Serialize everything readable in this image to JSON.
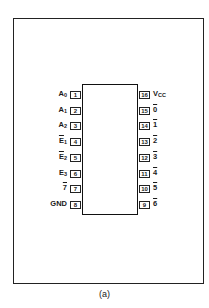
{
  "diagram": {
    "type": "ic-pinout",
    "package": "16-pin DIP",
    "caption": "(a)",
    "left_pins": [
      {
        "num": "1",
        "name": "A",
        "sub": "0",
        "overline": false
      },
      {
        "num": "2",
        "name": "A",
        "sub": "1",
        "overline": false
      },
      {
        "num": "3",
        "name": "A",
        "sub": "2",
        "overline": false
      },
      {
        "num": "4",
        "name": "E",
        "sub": "1",
        "overline": true
      },
      {
        "num": "5",
        "name": "E",
        "sub": "2",
        "overline": true
      },
      {
        "num": "6",
        "name": "E",
        "sub": "3",
        "overline": false
      },
      {
        "num": "7",
        "name": "7",
        "sub": "",
        "overline": true
      },
      {
        "num": "8",
        "name": "GND",
        "sub": "",
        "overline": false
      }
    ],
    "right_pins": [
      {
        "num": "16",
        "name": "V",
        "sub": "CC",
        "overline": false
      },
      {
        "num": "15",
        "name": "0",
        "sub": "",
        "overline": true
      },
      {
        "num": "14",
        "name": "1",
        "sub": "",
        "overline": true
      },
      {
        "num": "13",
        "name": "2",
        "sub": "",
        "overline": true
      },
      {
        "num": "12",
        "name": "3",
        "sub": "",
        "overline": true
      },
      {
        "num": "11",
        "name": "4",
        "sub": "",
        "overline": true
      },
      {
        "num": "10",
        "name": "5",
        "sub": "",
        "overline": true
      },
      {
        "num": "9",
        "name": "6",
        "sub": "",
        "overline": true
      }
    ]
  }
}
